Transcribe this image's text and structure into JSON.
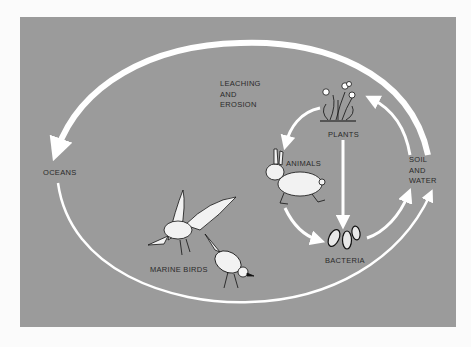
{
  "diagram": {
    "colors": {
      "background": "#fbfbfb",
      "panel": "#9b9b9b",
      "arrows": "#ffffff",
      "text": "#2a2a2a"
    },
    "labels": {
      "leaching": [
        "LEACHING",
        "AND",
        "EROSION"
      ],
      "oceans": "OCEANS",
      "plants": "PLANTS",
      "animals": "ANIMALS",
      "soil": [
        "SOIL",
        "AND",
        "WATER"
      ],
      "bacteria": "BACTERIA",
      "marine_birds": "MARINE BIRDS"
    },
    "nodes": [
      {
        "id": "plants",
        "icon": "plant-icon"
      },
      {
        "id": "animals",
        "icon": "rabbit-icon"
      },
      {
        "id": "bacteria",
        "icon": "bacteria-icon"
      },
      {
        "id": "soil_and_water",
        "icon": null
      },
      {
        "id": "oceans",
        "icon": null
      },
      {
        "id": "marine_birds",
        "icon": "bird-icon"
      }
    ],
    "flows": [
      {
        "from": "soil_and_water",
        "to": "oceans",
        "label": "LEACHING AND EROSION"
      },
      {
        "from": "oceans",
        "to": "soil_and_water",
        "via": "marine_birds"
      },
      {
        "from": "soil_and_water",
        "to": "plants"
      },
      {
        "from": "plants",
        "to": "animals"
      },
      {
        "from": "plants",
        "to": "bacteria"
      },
      {
        "from": "animals",
        "to": "bacteria"
      },
      {
        "from": "bacteria",
        "to": "soil_and_water"
      }
    ]
  }
}
